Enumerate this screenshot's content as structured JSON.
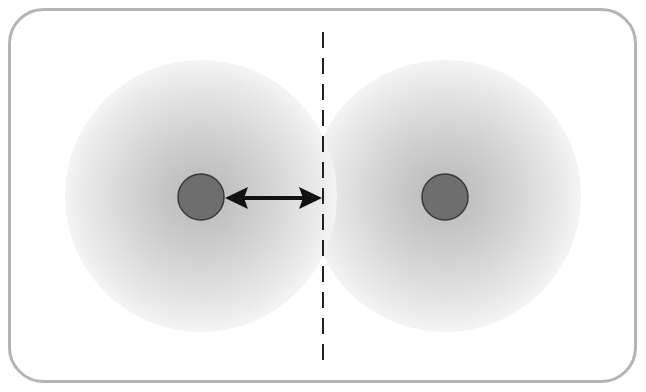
{
  "diagram": {
    "frame": {
      "stroke": "#b4b4b4",
      "fill": "#ffffff"
    },
    "atoms": [
      {
        "id": "left-atom",
        "cx": 201,
        "cy": 196,
        "cloud_radius": 135,
        "nucleus_radius": 23
      },
      {
        "id": "right-atom",
        "cx": 445,
        "cy": 196,
        "cloud_radius": 135,
        "nucleus_radius": 23
      }
    ],
    "colors": {
      "nucleus_fill": "#6e6e6e",
      "nucleus_stroke": "#3a3a3a",
      "cloud_inner": "#bdbdbd",
      "cloud_outer": "#f3f3f3",
      "arrow": "#111111",
      "dashed_line": "#222222"
    },
    "boundary_line": {
      "x": 323,
      "y1": 32,
      "y2": 362
    },
    "arrow": {
      "x1": 226,
      "x2": 322,
      "y": 198,
      "label": ""
    }
  }
}
